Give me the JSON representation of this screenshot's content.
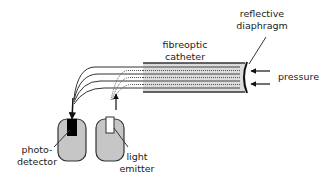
{
  "diagram": {
    "type": "fiberoptic pressure sensor schematic",
    "labels": {
      "reflective_diaphragm_line1": "reflective",
      "reflective_diaphragm_line2": "diaphragm",
      "catheter_line1": "fibreoptic",
      "catheter_line2": "catheter",
      "pressure": "pressure",
      "photodetector_line1": "photo-",
      "photodetector_line2": "detector",
      "emitter_line1": "light",
      "emitter_line2": "emitter"
    },
    "components": [
      {
        "name": "fibreoptic catheter"
      },
      {
        "name": "reflective diaphragm"
      },
      {
        "name": "photo-detector"
      },
      {
        "name": "light emitter"
      }
    ],
    "arrows": [
      {
        "from": "pressure",
        "to": "reflective diaphragm",
        "count": 2
      },
      {
        "from": "light emitter",
        "to": "emitting fibres",
        "direction": "up"
      },
      {
        "from": "receiving fibres",
        "to": "photo-detector",
        "direction": "down"
      }
    ],
    "colors": {
      "catheter_fill": "#d9d9d9",
      "device_fill": "#c8c8c8",
      "detector_element": "#000000",
      "emitter_element": "#ffffff",
      "stroke": "#222222"
    }
  }
}
